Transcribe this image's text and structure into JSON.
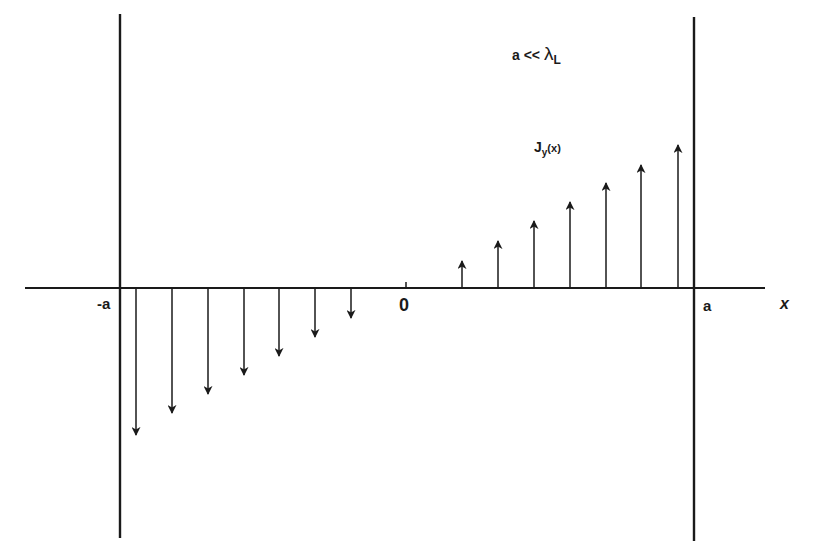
{
  "figure": {
    "condition_label": {
      "text": "a << ",
      "lambda": "λ",
      "lambda_sub": "L"
    },
    "current_label": {
      "main": "J",
      "sub": "y",
      "arg": "(x)"
    },
    "tick_labels": {
      "minus_a": "-a",
      "zero": "0",
      "plus_a": "a"
    },
    "axis_label": "x",
    "colors": {
      "ink": "#1a1a1a",
      "background": "#ffffff"
    }
  },
  "chart_data": {
    "type": "vector-field",
    "xlabel": "x",
    "ylabel": "J_y(x)",
    "xlim": [
      "-a",
      "a"
    ],
    "arrows": [
      {
        "x_px": 136,
        "tip_y": 435,
        "direction": "down"
      },
      {
        "x_px": 172,
        "tip_y": 413,
        "direction": "down"
      },
      {
        "x_px": 208,
        "tip_y": 394,
        "direction": "down"
      },
      {
        "x_px": 244,
        "tip_y": 375,
        "direction": "down"
      },
      {
        "x_px": 279,
        "tip_y": 356,
        "direction": "down"
      },
      {
        "x_px": 315,
        "tip_y": 337,
        "direction": "down"
      },
      {
        "x_px": 351,
        "tip_y": 318,
        "direction": "down"
      },
      {
        "x_px": 462,
        "tip_y": 261,
        "direction": "up"
      },
      {
        "x_px": 498,
        "tip_y": 241,
        "direction": "up"
      },
      {
        "x_px": 534,
        "tip_y": 221,
        "direction": "up"
      },
      {
        "x_px": 570,
        "tip_y": 202,
        "direction": "up"
      },
      {
        "x_px": 606,
        "tip_y": 183,
        "direction": "up"
      },
      {
        "x_px": 641,
        "tip_y": 165,
        "direction": "up"
      },
      {
        "x_px": 678,
        "tip_y": 145,
        "direction": "up"
      }
    ],
    "axis": {
      "y_px": 288,
      "x_start": 25,
      "x_end": 765
    },
    "walls": [
      {
        "x_px": 120,
        "y1": 14,
        "y2": 538
      },
      {
        "x_px": 694,
        "y1": 17,
        "y2": 541
      }
    ],
    "zero_tick_x_px": 406
  }
}
